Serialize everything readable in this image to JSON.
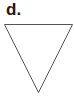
{
  "figure": {
    "label": "d.",
    "shape": "inverted-triangle",
    "stroke_color": "#555555",
    "fill_color": "#ffffff",
    "vertices": [
      [
        4,
        24
      ],
      [
        72,
        24
      ],
      [
        38,
        92
      ]
    ]
  }
}
